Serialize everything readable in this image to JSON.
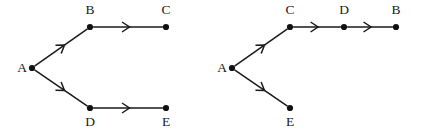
{
  "figure": {
    "width": 424,
    "height": 133,
    "background_color": "#ffffff",
    "stroke_color": "#1a1a1a",
    "node_fill_color": "#111111",
    "node_radius": 3.1
  },
  "diagrams": [
    {
      "id": "left-diagram",
      "name": "left-graph",
      "nodes": [
        {
          "id": "A",
          "label": "A",
          "x": 32,
          "y": 68,
          "label_x": 22,
          "label_y": 72
        },
        {
          "id": "B",
          "label": "B",
          "x": 90,
          "y": 27,
          "label_x": 90,
          "label_y": 14
        },
        {
          "id": "C",
          "label": "C",
          "x": 166,
          "y": 27,
          "label_x": 166,
          "label_y": 14
        },
        {
          "id": "D",
          "label": "D",
          "x": 90,
          "y": 108,
          "label_x": 90,
          "label_y": 126
        },
        {
          "id": "E",
          "label": "E",
          "x": 166,
          "y": 108,
          "label_x": 166,
          "label_y": 126
        }
      ],
      "edges": [
        {
          "from": "A",
          "to": "B",
          "arrow_t": 0.56
        },
        {
          "from": "A",
          "to": "D",
          "arrow_t": 0.56
        },
        {
          "from": "B",
          "to": "C",
          "arrow_t": 0.52
        },
        {
          "from": "D",
          "to": "E",
          "arrow_t": 0.52
        }
      ]
    },
    {
      "id": "right-diagram",
      "name": "right-graph",
      "nodes": [
        {
          "id": "A",
          "label": "A",
          "x": 232,
          "y": 68,
          "label_x": 222,
          "label_y": 72
        },
        {
          "id": "C",
          "label": "C",
          "x": 290,
          "y": 27,
          "label_x": 290,
          "label_y": 14
        },
        {
          "id": "D",
          "label": "D",
          "x": 344,
          "y": 27,
          "label_x": 344,
          "label_y": 14
        },
        {
          "id": "B",
          "label": "B",
          "x": 396,
          "y": 27,
          "label_x": 396,
          "label_y": 14
        },
        {
          "id": "E",
          "label": "E",
          "x": 290,
          "y": 108,
          "label_x": 290,
          "label_y": 126
        }
      ],
      "edges": [
        {
          "from": "A",
          "to": "C",
          "arrow_t": 0.56
        },
        {
          "from": "A",
          "to": "E",
          "arrow_t": 0.56
        },
        {
          "from": "C",
          "to": "D",
          "arrow_t": 0.52
        },
        {
          "from": "D",
          "to": "B",
          "arrow_t": 0.52
        }
      ]
    }
  ]
}
